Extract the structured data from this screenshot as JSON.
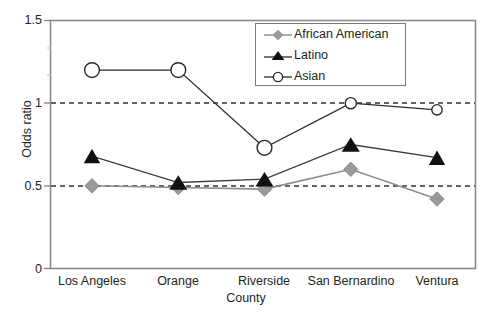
{
  "chart_data": {
    "type": "line",
    "title": "",
    "subtitle": "",
    "xlabel": "County",
    "ylabel": "Odds ratio",
    "categories": [
      "Los Angeles",
      "Orange",
      "Riverside",
      "San Bernardino",
      "Ventura"
    ],
    "ylim": [
      0,
      1.5
    ],
    "ytick_labels": [
      "0",
      "0.5",
      "1",
      "1.5"
    ],
    "ytick_values": [
      0,
      0.5,
      1,
      1.5
    ],
    "grid": "horizontal dashed reference lines at 0.5 and 1",
    "gridlines": [
      0.5,
      1
    ],
    "legend_position": "top-right inside plot area",
    "series": [
      {
        "name": "African American",
        "marker": "diamond",
        "color": "#8c8c8c",
        "values": [
          0.5,
          0.49,
          0.48,
          0.6,
          0.42
        ]
      },
      {
        "name": "Latino",
        "marker": "triangle",
        "color": "#1a1a1a",
        "values": [
          0.68,
          0.52,
          0.54,
          0.75,
          0.67
        ]
      },
      {
        "name": "Asian",
        "marker": "circle-open",
        "color": "#1a1a1a",
        "values": [
          1.2,
          1.2,
          0.73,
          1.0,
          0.96
        ]
      }
    ]
  },
  "axes": {
    "frame_color": "#808080",
    "gridline_color": "#3a3a3a",
    "tick_color": "#808080"
  }
}
